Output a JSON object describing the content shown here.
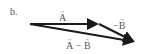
{
  "part_label": "b.",
  "vectors": {
    "a": {
      "name": "A",
      "label": "A",
      "start": [
        30,
        24
      ],
      "end": [
        99,
        24
      ]
    },
    "neg_b": {
      "name": "-B",
      "label_sign": "−",
      "label": "B",
      "start": [
        99,
        24
      ],
      "end": [
        136,
        42
      ]
    },
    "a_minus_b": {
      "name": "A - B",
      "label_left": "A",
      "label_op": " − ",
      "label_right": "B",
      "start": [
        30,
        24
      ],
      "end": [
        136,
        42
      ]
    }
  },
  "colors": {
    "stroke": "#1a1a1a",
    "text": "#555555"
  }
}
